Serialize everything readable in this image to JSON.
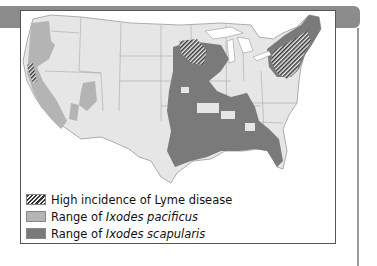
{
  "figure": {
    "title": "",
    "map_subject": "Contiguous United States",
    "colors": {
      "base_land": "#e6e6e6",
      "state_lines": "#9a9a9a",
      "ixodes_pacificus": "#b4b4b4",
      "ixodes_scapularis": "#7a7a7a",
      "hatch": "#333333",
      "header_bar": "#8c8c8c"
    }
  },
  "legend": {
    "items": [
      {
        "label_prefix": "High incidence of Lyme disease",
        "label_italic": "",
        "swatch": "hatch"
      },
      {
        "label_prefix": "Range of ",
        "label_italic": "Ixodes pacificus",
        "swatch": "light-gray"
      },
      {
        "label_prefix": "Range of ",
        "label_italic": "Ixodes scapularis",
        "swatch": "dark-gray"
      }
    ]
  }
}
